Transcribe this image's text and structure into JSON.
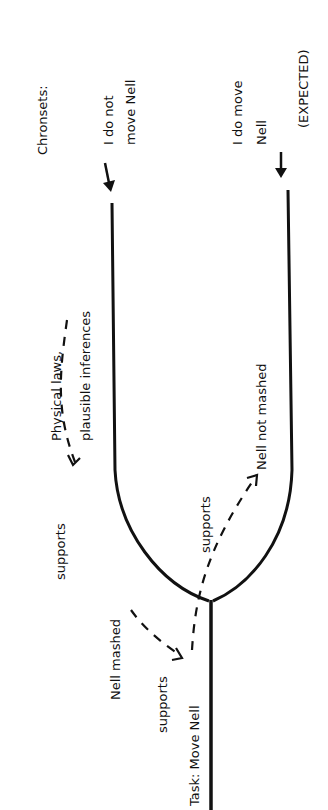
{
  "diagram": {
    "orientation": "rotated-90-ccw",
    "header": "Chronsets:",
    "chronsets": [
      {
        "label_line1": "I do not",
        "label_line2": "move Nell"
      },
      {
        "label_line1": "I do move",
        "label_line2": "Nell",
        "note": "(EXPECTED)"
      }
    ],
    "task": "Task: Move Nell",
    "facts": {
      "physical": {
        "line1": "Physical laws,",
        "line2": "plausible inferences"
      },
      "mashed": "Nell mashed",
      "not_mashed": "Nell not mashed"
    },
    "edges": [
      {
        "from": "Physical laws, plausible inferences",
        "to": "Nell mashed",
        "label": "supports"
      },
      {
        "from": "Nell mashed",
        "to": "Task: Move Nell",
        "label": "supports"
      },
      {
        "from": "Task: Move Nell",
        "to": "Nell not mashed",
        "label": "supports"
      }
    ]
  }
}
